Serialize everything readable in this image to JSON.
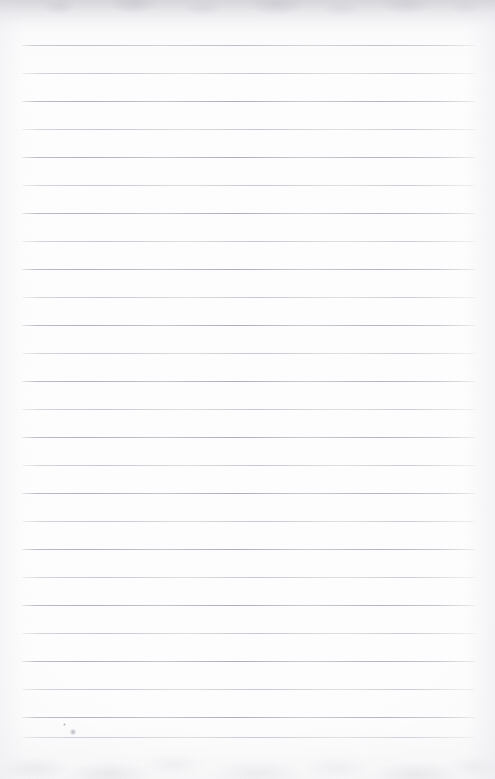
{
  "document": {
    "kind": "scanned-lined-notebook-page",
    "title": "Blank Ruled Notebook Page",
    "content_text": "",
    "handwriting_present": "no",
    "printed_text_present": "no",
    "page_width": 495,
    "page_height": 779
  },
  "paper": {
    "background_color": "#fdfdfd",
    "base_color": "#ffffff",
    "tint": "neutral-white"
  },
  "rules": {
    "count": 26,
    "first_line_y": 45,
    "spacing": 28,
    "left_x": 22,
    "right_x": 475,
    "thickness": 1,
    "color": "#a8acb8",
    "orientation": "horizontal",
    "margin_rule_present": "no",
    "lines": [
      {
        "index": 1,
        "y": 45,
        "weight": "normal"
      },
      {
        "index": 2,
        "y": 73,
        "weight": "faint"
      },
      {
        "index": 3,
        "y": 101,
        "weight": "normal"
      },
      {
        "index": 4,
        "y": 129,
        "weight": "faint"
      },
      {
        "index": 5,
        "y": 157,
        "weight": "normal"
      },
      {
        "index": 6,
        "y": 185,
        "weight": "faint"
      },
      {
        "index": 7,
        "y": 213,
        "weight": "normal"
      },
      {
        "index": 8,
        "y": 241,
        "weight": "faint"
      },
      {
        "index": 9,
        "y": 269,
        "weight": "normal"
      },
      {
        "index": 10,
        "y": 297,
        "weight": "faint"
      },
      {
        "index": 11,
        "y": 325,
        "weight": "normal"
      },
      {
        "index": 12,
        "y": 353,
        "weight": "faint"
      },
      {
        "index": 13,
        "y": 381,
        "weight": "normal"
      },
      {
        "index": 14,
        "y": 409,
        "weight": "faint"
      },
      {
        "index": 15,
        "y": 437,
        "weight": "normal"
      },
      {
        "index": 16,
        "y": 465,
        "weight": "faint"
      },
      {
        "index": 17,
        "y": 493,
        "weight": "normal"
      },
      {
        "index": 18,
        "y": 521,
        "weight": "faint"
      },
      {
        "index": 19,
        "y": 549,
        "weight": "normal"
      },
      {
        "index": 20,
        "y": 577,
        "weight": "faint"
      },
      {
        "index": 21,
        "y": 605,
        "weight": "normal"
      },
      {
        "index": 22,
        "y": 633,
        "weight": "faint"
      },
      {
        "index": 23,
        "y": 661,
        "weight": "normal"
      },
      {
        "index": 24,
        "y": 689,
        "weight": "faint"
      },
      {
        "index": 25,
        "y": 717,
        "weight": "normal"
      },
      {
        "index": 26,
        "y": 737,
        "weight": "faint"
      }
    ]
  },
  "artifacts": {
    "top_shadow": {
      "present": "yes",
      "height": 34,
      "color": "#cdcdd2"
    },
    "top_mottle": {
      "present": "yes",
      "height": 40
    },
    "bottom_mottle": {
      "present": "yes",
      "height": 56
    },
    "left_edge_shade": {
      "present": "yes",
      "width": 26
    },
    "right_edge_shade": {
      "present": "yes",
      "width": 30
    },
    "specks": [
      {
        "name": "speck-bottom-left",
        "x": 70,
        "y": 729,
        "width": 6,
        "height": 6,
        "color": "#9698a0"
      },
      {
        "name": "speck-faint-upper",
        "x": 63,
        "y": 723,
        "width": 3,
        "height": 3,
        "color": "#b4b6be"
      }
    ]
  }
}
